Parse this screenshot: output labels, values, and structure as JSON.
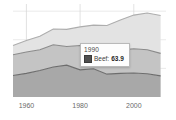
{
  "chart_data": {
    "type": "area",
    "title": "",
    "subtitle": "",
    "xlabel": "",
    "ylabel": "",
    "stacked": true,
    "grid": true,
    "legend_position": "none",
    "xlim": [
      1955,
      2012
    ],
    "ylim": [
      0,
      260
    ],
    "x": [
      1955,
      1960,
      1965,
      1970,
      1975,
      1980,
      1985,
      1990,
      1995,
      2000,
      2005,
      2010
    ],
    "xticks": [
      1960,
      1980,
      2000
    ],
    "xtick_labels": [
      "1960",
      "1980",
      "2000"
    ],
    "gridlines_x": [
      1960,
      1980,
      2000
    ],
    "gridlines_y": [
      80,
      160,
      240
    ],
    "series": [
      {
        "name": "Beef",
        "color": "#a8a8a8",
        "line_color": "#6d6d6d",
        "values": [
          60,
          66,
          74,
          84,
          89,
          76,
          79,
          63.9,
          66,
          67,
          65,
          59
        ]
      },
      {
        "name": "Pork",
        "color": "#c4c4c4",
        "line_color": "#8a8a8a",
        "values": [
          58,
          60,
          58,
          62,
          52,
          68,
          62,
          64,
          65,
          68,
          67,
          63
        ]
      },
      {
        "name": "Poultry",
        "color": "#e3e3e3",
        "line_color": "#adadad",
        "values": [
          26,
          32,
          38,
          44,
          48,
          52,
          60,
          72,
          84,
          94,
          103,
          106
        ]
      }
    ]
  },
  "tooltip": {
    "title": "1990",
    "series_label": "Beef:",
    "value": "63.9",
    "swatch_color": "#4f4f4f",
    "visible": true
  },
  "axis": {
    "tick_labels": [
      "1960",
      "1980",
      "2000"
    ]
  }
}
